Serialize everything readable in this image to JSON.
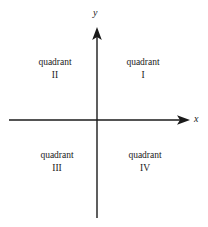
{
  "figure": {
    "background_color": "#ffffff",
    "line_color": "#1a1a1a",
    "width": 208,
    "height": 227
  },
  "axes": {
    "x": {
      "label": "x",
      "label_position": {
        "x": 196,
        "y": 119
      },
      "line": {
        "x1": 9,
        "y1": 120,
        "x2": 190,
        "y2": 120
      },
      "arrow": "right"
    },
    "y": {
      "label": "y",
      "label_position": {
        "x": 97,
        "y": 14
      },
      "line": {
        "x1": 97,
        "y1": 27,
        "x2": 97,
        "y2": 218
      },
      "arrow": "up"
    },
    "origin": {
      "x": 97,
      "y": 120
    }
  },
  "quadrants": [
    {
      "id": "i",
      "word": "quadrant",
      "numeral": "I",
      "center": {
        "x": 143,
        "y": 65
      }
    },
    {
      "id": "ii",
      "word": "quadrant",
      "numeral": "II",
      "center": {
        "x": 55,
        "y": 65
      }
    },
    {
      "id": "iii",
      "word": "quadrant",
      "numeral": "III",
      "center": {
        "x": 57,
        "y": 158
      }
    },
    {
      "id": "iv",
      "word": "quadrant",
      "numeral": "IV",
      "center": {
        "x": 145,
        "y": 158
      }
    }
  ]
}
